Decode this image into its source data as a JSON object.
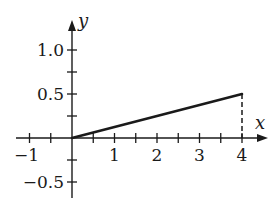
{
  "chart_data": {
    "type": "line",
    "title": "",
    "xlabel": "x",
    "ylabel": "y",
    "xlim": [
      -1.3,
      4.6
    ],
    "ylim": [
      -0.6,
      1.3
    ],
    "grid": false,
    "legend": null,
    "x_ticks": [
      -1,
      -0.5,
      0,
      0.5,
      1,
      1.5,
      2,
      2.5,
      3,
      3.5,
      4
    ],
    "x_tick_labels": [
      {
        "value": -1,
        "label": "−1"
      },
      {
        "value": 1,
        "label": "1"
      },
      {
        "value": 2,
        "label": "2"
      },
      {
        "value": 3,
        "label": "3"
      },
      {
        "value": 4,
        "label": "4"
      }
    ],
    "y_ticks": [
      -0.5,
      -0.25,
      0.25,
      0.5,
      0.75,
      1.0
    ],
    "y_tick_labels": [
      {
        "value": 1.0,
        "label": "1.0"
      },
      {
        "value": 0.5,
        "label": "0.5"
      },
      {
        "value": -0.5,
        "label": "−0.5"
      }
    ],
    "series": [
      {
        "name": "segment",
        "style": "solid",
        "x": [
          0,
          4
        ],
        "y": [
          0,
          0.5
        ]
      },
      {
        "name": "drop-line",
        "style": "dashed",
        "x": [
          4,
          4
        ],
        "y": [
          0.5,
          0
        ]
      }
    ],
    "colors": {
      "ink": "#1a1a1a",
      "background": "#ffffff"
    }
  },
  "layout": {
    "origin_px": [
      72,
      138
    ],
    "x_unit_px": 42.5,
    "y_unit_px": 88,
    "x_axis_px": [
      16,
      268
    ],
    "y_axis_px": [
      198,
      20
    ]
  }
}
